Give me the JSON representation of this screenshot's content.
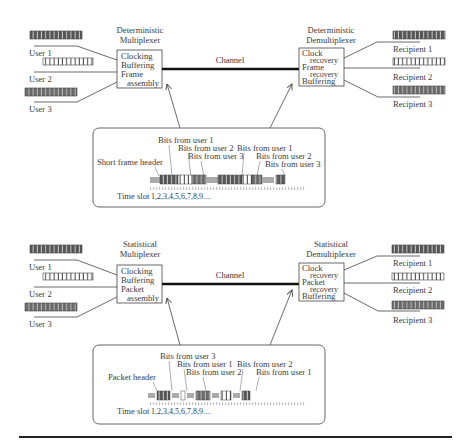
{
  "panels": [
    {
      "id": "deterministic",
      "mux_title": [
        "Deterministic",
        "Multiplexer"
      ],
      "mux_functions": [
        "Clocking",
        "Buffering",
        "Frame",
        "assembly"
      ],
      "demux_title": [
        "Deterministic",
        "Demultiplexer"
      ],
      "demux_functions": [
        "Clock",
        "recovery",
        "Frame",
        "recovery",
        "Buffering"
      ],
      "channel_label": "Channel",
      "users": [
        "User 1",
        "User 2",
        "User 3"
      ],
      "recipients": [
        "Recipient 1",
        "Recipient 2",
        "Recipient 3"
      ],
      "header_label": "Short frame header",
      "bit_labels": [
        "Bits from user 1",
        "Bits from user 2",
        "Bits from user 3",
        "Bits from user 1",
        "Bits from user 2",
        "Bits from user 3"
      ],
      "time_slot_label": "Time slot",
      "time_slot_values": "1,2,3,4,5,6,7,8,9...."
    },
    {
      "id": "statistical",
      "mux_title": [
        "Statistical",
        "Multiplexer"
      ],
      "mux_functions": [
        "Clocking",
        "Buffering",
        "Packet",
        "assembly"
      ],
      "demux_title": [
        "Statistical",
        "Demultiplexer"
      ],
      "demux_functions": [
        "Clock",
        "recovery",
        "Packet",
        "recovery",
        "Buffering"
      ],
      "channel_label": "Channel",
      "users": [
        "User 1",
        "User 2",
        "User 3"
      ],
      "recipients": [
        "Recipient 1",
        "Recipient 2",
        "Recipient 3"
      ],
      "header_label": "Packet header",
      "bit_labels": [
        "Bits from user 3",
        "Bits from user 1",
        "Bits from user 2",
        "Bits from user 2",
        "Bits from user 1"
      ],
      "time_slot_label": "Time slot",
      "time_slot_values": "1,2,3,4,5,6,7,8,9...."
    }
  ],
  "colors": {
    "user1_bits": "#5a5a5a",
    "user2_bits": "#ffffff",
    "user3_bits": "#6e6e6e",
    "header": "#a8a8a8",
    "line": "#444444",
    "channel": "#111111"
  }
}
